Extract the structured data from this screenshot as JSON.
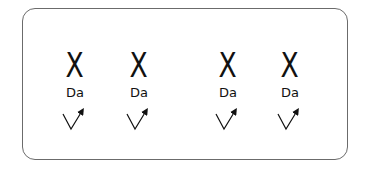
{
  "diagram": {
    "groups": [
      {
        "mark": "X",
        "label": "Da",
        "icon": "check-arrow-icon",
        "center_x": 75
      },
      {
        "mark": "X",
        "label": "Da",
        "icon": "check-arrow-icon",
        "center_x": 139
      },
      {
        "mark": "X",
        "label": "Da",
        "icon": "check-arrow-icon",
        "center_x": 228
      },
      {
        "mark": "X",
        "label": "Da",
        "icon": "check-arrow-icon",
        "center_x": 290
      }
    ],
    "colors": {
      "border": "#6b6b6b",
      "ink": "#111111",
      "background": "#ffffff"
    }
  }
}
